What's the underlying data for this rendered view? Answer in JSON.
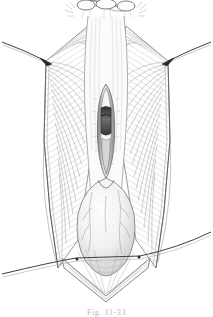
{
  "figure": {
    "caption": "Fig. 11-33",
    "style": "pen-and-ink line engraving, stipple and cross-hatch shading",
    "background_color": "#ffffff",
    "ink_color": "#2b2b2b",
    "mid_tone_color": "#8a8a8a",
    "light_tone_color": "#c8c8c8",
    "dark_fill_color": "#3a3a3a",
    "canvas": {
      "width": 213,
      "height": 317
    }
  },
  "structures": {
    "top_clamps": {
      "label": "tissue clamps at superior margin",
      "count": 3,
      "y_position": 6
    },
    "left_flap": {
      "label": "left retracted tissue flap",
      "shading": "radiating fine hatch lines"
    },
    "right_flap": {
      "label": "right retracted tissue flap",
      "shading": "radiating fine hatch lines"
    },
    "left_suture": {
      "label": "left lateral retraction suture",
      "anchor_x": 46,
      "anchor_y": 61
    },
    "right_suture": {
      "label": "right lateral retraction suture",
      "anchor_x": 168,
      "anchor_y": 61
    },
    "lower_suture": {
      "label": "inferior traction suture crossing field",
      "left_end_y": 270,
      "right_end_y": 238
    },
    "midline_incision": {
      "label": "vertical midline incision",
      "top_y": 84,
      "bottom_y": 178
    },
    "dark_lumen": {
      "label": "exposed dark lumen within incision",
      "top_y": 108,
      "bottom_y": 133
    },
    "bulb": {
      "label": "rounded bulbous structure (inferior)",
      "center_x": 106,
      "center_y": 224,
      "vessels": "fine branching vascular markings"
    },
    "apex": {
      "label": "inferior converging apex of field",
      "y": 292
    }
  },
  "annotations": {
    "visible_labels": [],
    "leader_lines": 0
  }
}
